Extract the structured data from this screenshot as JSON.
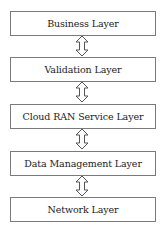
{
  "diagram": {
    "type": "layered-stack",
    "layers": [
      {
        "label": "Business Layer"
      },
      {
        "label": "Validation Layer"
      },
      {
        "label": "Cloud RAN Service Layer"
      },
      {
        "label": "Data Management Layer"
      },
      {
        "label": "Network Layer"
      }
    ],
    "connectors": [
      {
        "from": "Business Layer",
        "to": "Validation Layer",
        "type": "bidirectional-arrow"
      },
      {
        "from": "Validation Layer",
        "to": "Cloud RAN Service Layer",
        "type": "bidirectional-arrow"
      },
      {
        "from": "Cloud RAN Service Layer",
        "to": "Data Management Layer",
        "type": "bidirectional-arrow"
      },
      {
        "from": "Data Management Layer",
        "to": "Network Layer",
        "type": "bidirectional-arrow"
      }
    ],
    "colors": {
      "border": "#7a7a7a",
      "text": "#222222",
      "arrow_stroke": "#555555"
    }
  }
}
